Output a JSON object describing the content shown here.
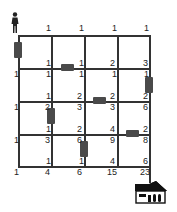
{
  "diagram": {
    "start_icon": "person-icon",
    "end_icon": "house-icon",
    "grid": {
      "xs": [
        18,
        51,
        84,
        117,
        149
      ],
      "ys": [
        35,
        68,
        101,
        134,
        166
      ]
    },
    "labels": [
      {
        "id": "r0c1t",
        "text": "1",
        "x": 46,
        "y": 24
      },
      {
        "id": "r0c2t",
        "text": "1",
        "x": 79,
        "y": 24
      },
      {
        "id": "r0c3t",
        "text": "1",
        "x": 112,
        "y": 24
      },
      {
        "id": "r0c4t",
        "text": "1",
        "x": 144,
        "y": 24
      },
      {
        "id": "r1c1t",
        "text": "1",
        "x": 46,
        "y": 59
      },
      {
        "id": "r1c2t",
        "text": "1",
        "x": 79,
        "y": 59
      },
      {
        "id": "r1c3t",
        "text": "2",
        "x": 110,
        "y": 59
      },
      {
        "id": "r1c4t",
        "text": "3",
        "x": 143,
        "y": 59
      },
      {
        "id": "r1c0b",
        "text": "1",
        "x": 14,
        "y": 70
      },
      {
        "id": "r1c1b",
        "text": "1",
        "x": 46,
        "y": 70
      },
      {
        "id": "r1c2b",
        "text": "1",
        "x": 79,
        "y": 70
      },
      {
        "id": "r1c3b",
        "text": "1",
        "x": 112,
        "y": 70
      },
      {
        "id": "r1c4b",
        "text": "1",
        "x": 144,
        "y": 70
      },
      {
        "id": "r2c1t",
        "text": "1",
        "x": 46,
        "y": 92
      },
      {
        "id": "r2c2t",
        "text": "2",
        "x": 77,
        "y": 92
      },
      {
        "id": "r2c3t",
        "text": "2",
        "x": 110,
        "y": 92
      },
      {
        "id": "r2c4t",
        "text": "2",
        "x": 143,
        "y": 92
      },
      {
        "id": "r2c0b",
        "text": "1",
        "x": 14,
        "y": 103
      },
      {
        "id": "r2c1b",
        "text": "2",
        "x": 45,
        "y": 103
      },
      {
        "id": "r2c2b",
        "text": "3",
        "x": 77,
        "y": 103
      },
      {
        "id": "r2c3b",
        "text": "3",
        "x": 110,
        "y": 103
      },
      {
        "id": "r2c4b",
        "text": "6",
        "x": 143,
        "y": 103
      },
      {
        "id": "r3c1t",
        "text": "1",
        "x": 46,
        "y": 125
      },
      {
        "id": "r3c2t",
        "text": "2",
        "x": 77,
        "y": 125
      },
      {
        "id": "r3c3t",
        "text": "4",
        "x": 110,
        "y": 125
      },
      {
        "id": "r3c4t",
        "text": "2",
        "x": 143,
        "y": 125
      },
      {
        "id": "r3c0b",
        "text": "1",
        "x": 14,
        "y": 136
      },
      {
        "id": "r3c1b",
        "text": "3",
        "x": 45,
        "y": 136
      },
      {
        "id": "r3c2b",
        "text": "6",
        "x": 77,
        "y": 136
      },
      {
        "id": "r3c3b",
        "text": "9",
        "x": 110,
        "y": 136
      },
      {
        "id": "r3c4b",
        "text": "8",
        "x": 143,
        "y": 136
      },
      {
        "id": "r4c1t",
        "text": "1",
        "x": 46,
        "y": 157
      },
      {
        "id": "r4c2t",
        "text": "1",
        "x": 79,
        "y": 157
      },
      {
        "id": "r4c3t",
        "text": "4",
        "x": 110,
        "y": 157
      },
      {
        "id": "r4c4t",
        "text": "6",
        "x": 143,
        "y": 157
      },
      {
        "id": "r4c0b",
        "text": "1",
        "x": 14,
        "y": 168
      },
      {
        "id": "r4c1b",
        "text": "4",
        "x": 45,
        "y": 168
      },
      {
        "id": "r4c2b",
        "text": "6",
        "x": 77,
        "y": 168
      },
      {
        "id": "r4c3b",
        "text": "15",
        "x": 107,
        "y": 168
      },
      {
        "id": "r4c4b",
        "text": "23",
        "x": 140,
        "y": 168
      }
    ],
    "blocked_roads": [
      {
        "id": "b1",
        "orientation": "vertical",
        "x": 14,
        "y": 42,
        "w": 8,
        "h": 16
      },
      {
        "id": "b2",
        "orientation": "horizontal",
        "x": 61,
        "y": 64,
        "w": 13,
        "h": 7
      },
      {
        "id": "b3",
        "orientation": "vertical",
        "x": 145,
        "y": 77,
        "w": 8,
        "h": 16
      },
      {
        "id": "b4",
        "orientation": "horizontal",
        "x": 93,
        "y": 97,
        "w": 13,
        "h": 7
      },
      {
        "id": "b5",
        "orientation": "vertical",
        "x": 47,
        "y": 108,
        "w": 8,
        "h": 16
      },
      {
        "id": "b6",
        "orientation": "horizontal",
        "x": 126,
        "y": 130,
        "w": 13,
        "h": 7
      },
      {
        "id": "b7",
        "orientation": "vertical",
        "x": 80,
        "y": 141,
        "w": 8,
        "h": 16
      }
    ],
    "colors": {
      "line": "#333333",
      "block": "#4a4a4a",
      "text": "#222222"
    }
  }
}
